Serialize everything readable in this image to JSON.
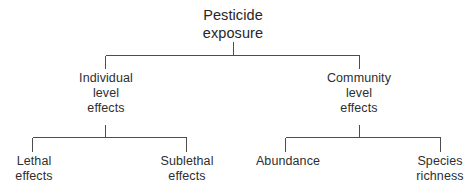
{
  "diagram": {
    "type": "hierarchy-tree",
    "orientation": "top-down",
    "levels": 3,
    "line_color": "#4d4d4d",
    "text_color": "#2e2e2e",
    "background_color": "#ffffff",
    "root": {
      "id": "pesticide-exposure",
      "line1": "Pesticide",
      "line2": "exposure"
    },
    "level2": [
      {
        "id": "individual-level-effects",
        "line1": "Individual",
        "line2": "level",
        "line3": "effects"
      },
      {
        "id": "community-level-effects",
        "line1": "Community",
        "line2": "level",
        "line3": "effects"
      }
    ],
    "level3": [
      {
        "id": "lethal-effects",
        "parent": "individual-level-effects",
        "line1": "Lethal",
        "line2": "effects"
      },
      {
        "id": "sublethal-effects",
        "parent": "individual-level-effects",
        "line1": "Sublethal",
        "line2": "effects"
      },
      {
        "id": "abundance",
        "parent": "community-level-effects",
        "line1": "Abundance",
        "line2": ""
      },
      {
        "id": "species-richness",
        "parent": "community-level-effects",
        "line1": "Species",
        "line2": "richness"
      }
    ]
  }
}
